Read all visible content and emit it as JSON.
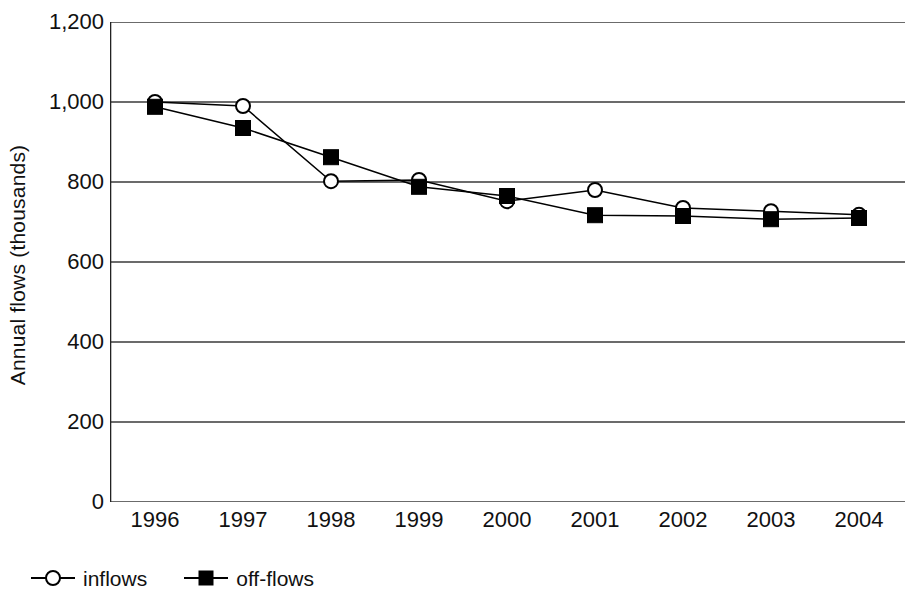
{
  "chart_data": {
    "type": "line",
    "title": "",
    "xlabel": "",
    "ylabel": "Annual flows (thousands)",
    "categories": [
      "1996",
      "1997",
      "1998",
      "1999",
      "2000",
      "2001",
      "2002",
      "2003",
      "2004"
    ],
    "ylim": [
      0,
      1200
    ],
    "yticks": [
      {
        "value": 1200,
        "label": "1,200"
      },
      {
        "value": 1000,
        "label": "1,000"
      },
      {
        "value": 800,
        "label": "800"
      },
      {
        "value": 600,
        "label": "600"
      },
      {
        "value": 400,
        "label": "400"
      },
      {
        "value": 200,
        "label": "200"
      },
      {
        "value": 0,
        "label": "0"
      }
    ],
    "grid": "horizontal",
    "legend_position": "bottom-left",
    "series": [
      {
        "name": "inflows",
        "marker": "open-circle",
        "color": "#000000",
        "values": [
          1000,
          990,
          802,
          805,
          752,
          780,
          735,
          727,
          718
        ]
      },
      {
        "name": "off-flows",
        "marker": "filled-square",
        "color": "#000000",
        "values": [
          988,
          935,
          862,
          788,
          765,
          717,
          715,
          707,
          710
        ]
      }
    ]
  },
  "legend": {
    "items": [
      {
        "label": "inflows",
        "marker": "open-circle"
      },
      {
        "label": "off-flows",
        "marker": "filled-square"
      }
    ]
  }
}
